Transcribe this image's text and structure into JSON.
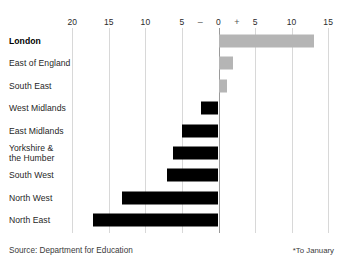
{
  "chart_data": {
    "type": "bar",
    "orientation": "horizontal",
    "title": "",
    "xlabel": "",
    "ylabel": "",
    "categories": [
      "London",
      "East of England",
      "South East",
      "West Midlands",
      "East Midlands",
      "Yorkshire &\nthe Humber",
      "South West",
      "North West",
      "North East"
    ],
    "values": [
      13.1,
      2.0,
      1.2,
      -2.4,
      -5.0,
      -6.2,
      -7.1,
      -13.2,
      -17.2
    ],
    "bar_colors": [
      "#b5b5b5",
      "#b5b5b5",
      "#b5b5b5",
      "#000000",
      "#000000",
      "#000000",
      "#000000",
      "#000000",
      "#000000"
    ],
    "highlight_category": "London",
    "xlim": [
      -21.5,
      15.0
    ],
    "axis_min_label": -20,
    "axis_max_label": 15,
    "tick_values": [
      -20,
      -15,
      -10,
      -5,
      0,
      5,
      10,
      15
    ],
    "tick_labels": [
      "20",
      "15",
      "10",
      "5",
      "0",
      "5",
      "10",
      "15"
    ],
    "sign_markers": [
      {
        "value": -2.5,
        "label": "–"
      },
      {
        "value": 2.5,
        "label": "+"
      }
    ],
    "grid": true,
    "grid_color": "#d8d8d8",
    "zero_line_color": "#9a9a9a",
    "legend": null
  },
  "footer": {
    "source": "Source: Department for Education",
    "note": "*To January"
  },
  "colors": {
    "bar_grey": "#b5b5b5",
    "bar_black": "#000000",
    "grid": "#d8d8d8",
    "zero_line": "#9a9a9a",
    "text": "#1f1f1f",
    "background": "#ffffff"
  }
}
